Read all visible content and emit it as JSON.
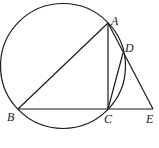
{
  "diagram": {
    "type": "geometry",
    "circle": {
      "cx": 63,
      "cy": 66,
      "r": 62.5
    },
    "points": {
      "A": {
        "x": 108,
        "y": 23,
        "label": "A",
        "lx": 111,
        "ly": 25
      },
      "B": {
        "x": 18,
        "y": 109,
        "label": "B",
        "lx": 7,
        "ly": 121
      },
      "C": {
        "x": 108,
        "y": 109,
        "label": "C",
        "lx": 104,
        "ly": 123
      },
      "D": {
        "x": 123,
        "y": 53,
        "label": "D",
        "lx": 125,
        "ly": 52
      },
      "E": {
        "x": 153,
        "y": 109,
        "label": "E",
        "lx": 146,
        "ly": 123
      }
    },
    "segments": [
      [
        "A",
        "B"
      ],
      [
        "A",
        "C"
      ],
      [
        "B",
        "E"
      ],
      [
        "A",
        "E"
      ],
      [
        "C",
        "D"
      ]
    ]
  }
}
